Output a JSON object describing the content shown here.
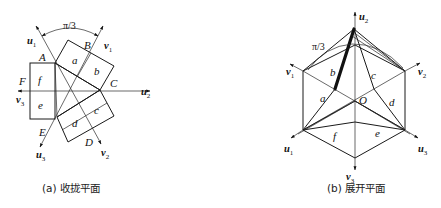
{
  "figure": {
    "panel_a": {
      "caption": "(a) 收拢平面",
      "angle_label": "π/3",
      "points": [
        "A",
        "B",
        "C",
        "D",
        "E",
        "F"
      ],
      "faces": [
        "a",
        "b",
        "c",
        "d",
        "e",
        "f"
      ],
      "vectors": [
        {
          "name": "u",
          "sub": "1"
        },
        {
          "name": "v",
          "sub": "1"
        },
        {
          "name": "u",
          "sub": "2"
        },
        {
          "name": "v",
          "sub": "2"
        },
        {
          "name": "u",
          "sub": "3"
        },
        {
          "name": "v",
          "sub": "3"
        }
      ]
    },
    "panel_b": {
      "caption": "(b) 展开平面",
      "angle_label": "π/3",
      "center_label": "O",
      "faces": [
        "a",
        "b",
        "c",
        "d",
        "e",
        "f"
      ],
      "vectors": [
        {
          "name": "u",
          "sub": "2"
        },
        {
          "name": "v",
          "sub": "1"
        },
        {
          "name": "v",
          "sub": "2"
        },
        {
          "name": "u",
          "sub": "1"
        },
        {
          "name": "u",
          "sub": "3"
        },
        {
          "name": "v",
          "sub": "3"
        }
      ]
    }
  }
}
